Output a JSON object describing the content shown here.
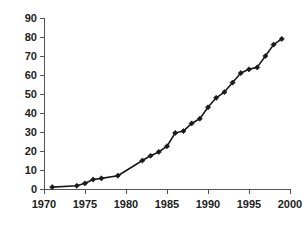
{
  "chart_data": {
    "type": "line",
    "title": "",
    "subtitle": "",
    "xlabel": "",
    "ylabel": "",
    "xlim": [
      1970,
      2000
    ],
    "ylim": [
      0,
      90
    ],
    "xticks": [
      1970,
      1975,
      1980,
      1985,
      1990,
      1995,
      2000
    ],
    "xtick_labels": [
      "1970",
      "1975",
      "1980",
      "1985",
      "1990",
      "1995",
      "2000"
    ],
    "yticks": [
      0,
      10,
      20,
      30,
      40,
      50,
      60,
      70,
      80,
      90
    ],
    "ytick_labels": [
      "0",
      "10",
      "20",
      "30",
      "40",
      "50",
      "60",
      "70",
      "80",
      "90"
    ],
    "grid": false,
    "legend": false,
    "legend_position": "none",
    "marker": "diamond",
    "line_color": "#1a1a1a",
    "marker_color": "#1a1a1a",
    "axis_color": "#555555",
    "background_color": "#ffffff",
    "x": [
      1971,
      1974,
      1975,
      1976,
      1977,
      1979,
      1982,
      1983,
      1984,
      1985,
      1986,
      1987,
      1988,
      1989,
      1990,
      1991,
      1992,
      1993,
      1994,
      1995,
      1996,
      1997,
      1998,
      1999
    ],
    "series": [
      {
        "name": "series-1",
        "values": [
          1,
          1.7,
          3,
          5,
          5.6,
          7,
          15,
          17.5,
          19.5,
          22.5,
          29.5,
          30.5,
          34.5,
          37,
          43,
          48,
          51,
          56,
          61,
          63,
          64,
          70,
          76,
          79
        ]
      }
    ]
  }
}
